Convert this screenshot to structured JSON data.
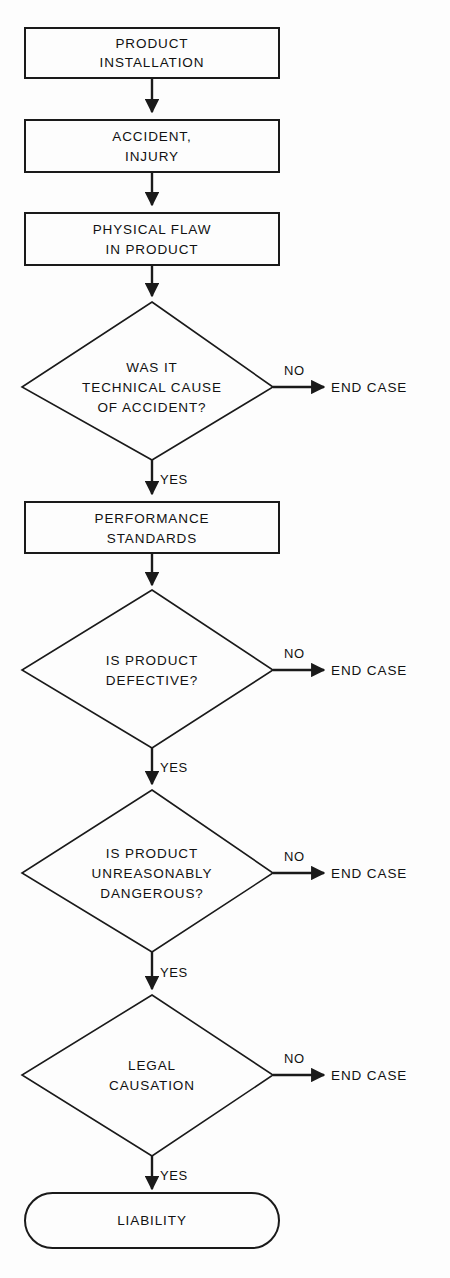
{
  "diagram": {
    "type": "flowchart",
    "colors": {
      "background": "#fdfdfd",
      "stroke": "#1a1a1a",
      "text": "#111111"
    },
    "nodes": [
      {
        "id": "product-installation",
        "shape": "process",
        "lines": [
          "PRODUCT",
          "INSTALLATION"
        ]
      },
      {
        "id": "accident-injury",
        "shape": "process",
        "lines": [
          "ACCIDENT,",
          "INJURY"
        ]
      },
      {
        "id": "physical-flaw",
        "shape": "process",
        "lines": [
          "PHYSICAL FLAW",
          "IN PRODUCT"
        ]
      },
      {
        "id": "technical-cause",
        "shape": "decision",
        "lines": [
          "WAS IT",
          "TECHNICAL CAUSE",
          "OF ACCIDENT?"
        ]
      },
      {
        "id": "performance-standards",
        "shape": "process",
        "lines": [
          "PERFORMANCE",
          "STANDARDS"
        ]
      },
      {
        "id": "product-defective",
        "shape": "decision",
        "lines": [
          "IS PRODUCT",
          "DEFECTIVE?"
        ]
      },
      {
        "id": "unreasonably-dangerous",
        "shape": "decision",
        "lines": [
          "IS PRODUCT",
          "UNREASONABLY",
          "DANGEROUS?"
        ]
      },
      {
        "id": "legal-causation",
        "shape": "decision",
        "lines": [
          "LEGAL",
          "CAUSATION"
        ]
      },
      {
        "id": "liability",
        "shape": "terminator",
        "lines": [
          "LIABILITY"
        ]
      }
    ],
    "end_terminals": [
      {
        "id": "end-case-1",
        "label": "END CASE"
      },
      {
        "id": "end-case-2",
        "label": "END CASE"
      },
      {
        "id": "end-case-3",
        "label": "END CASE"
      },
      {
        "id": "end-case-4",
        "label": "END CASE"
      }
    ],
    "edge_labels": {
      "no": "NO",
      "yes": "YES"
    },
    "branches": [
      {
        "from": "technical-cause",
        "no": "NO",
        "no_target": "END CASE",
        "yes": "YES",
        "yes_target": "performance-standards"
      },
      {
        "from": "product-defective",
        "no": "NO",
        "no_target": "END CASE",
        "yes": "YES",
        "yes_target": "unreasonably-dangerous"
      },
      {
        "from": "unreasonably-dangerous",
        "no": "NO",
        "no_target": "END CASE",
        "yes": "YES",
        "yes_target": "legal-causation"
      },
      {
        "from": "legal-causation",
        "no": "NO",
        "no_target": "END CASE",
        "yes": "YES",
        "yes_target": "liability"
      }
    ]
  }
}
